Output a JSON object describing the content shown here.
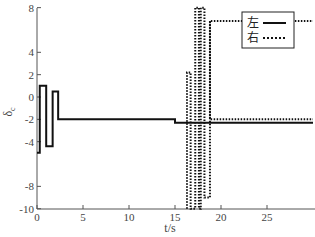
{
  "chart_data": {
    "type": "line",
    "title": "",
    "xlabel": "t/s",
    "ylabel": "δ_c",
    "xlim": [
      0,
      30
    ],
    "ylim": [
      -10,
      8
    ],
    "xticks": [
      0,
      5,
      10,
      15,
      20,
      25
    ],
    "yticks": [
      8,
      4,
      2,
      0,
      -2,
      -4,
      -8,
      -10
    ],
    "grid": false,
    "legend_position": "upper right",
    "series": [
      {
        "name": "左",
        "style": "solid",
        "x": [
          0,
          0.3,
          0.3,
          1.0,
          1.0,
          1.6,
          1.6,
          1.7,
          1.7,
          2.3,
          2.3,
          2.4,
          2.4,
          15.0,
          15.0,
          30.0
        ],
        "y": [
          -5,
          -5,
          1.0,
          1.0,
          -4.4,
          -4.4,
          -4.4,
          -4.4,
          0.5,
          0.5,
          -2.0,
          -2.0,
          -2.0,
          -2.0,
          -2.3,
          -2.3
        ]
      },
      {
        "name": "右",
        "style": "dotted",
        "x": [
          16.3,
          16.3,
          16.7,
          16.7,
          17.2,
          17.2,
          17.6,
          17.6,
          17.8,
          17.8,
          18.2,
          18.2,
          18.8,
          18.8,
          30.0
        ],
        "y": [
          -10,
          2.2,
          2.2,
          -10,
          -10,
          8,
          8,
          -10,
          -10,
          8,
          8,
          -9,
          -9,
          6.8,
          6.8
        ]
      }
    ],
    "right_series_tail": {
      "x": [
        18.8,
        18.8,
        30.0
      ],
      "y": [
        6.8,
        -2.0,
        -2.0
      ]
    }
  },
  "legend": {
    "items": [
      {
        "label": "左",
        "style": "solid"
      },
      {
        "label": "右",
        "style": "dotted"
      }
    ]
  },
  "axes": {
    "xlabel": "t/s",
    "ylabel_main": "δ",
    "ylabel_sub": "c",
    "xtick_labels": [
      "0",
      "5",
      "10",
      "15",
      "20",
      "25"
    ],
    "ytick_labels": [
      "8",
      "4",
      "2",
      "0",
      "-2",
      "-4",
      "-8",
      "-10"
    ]
  }
}
